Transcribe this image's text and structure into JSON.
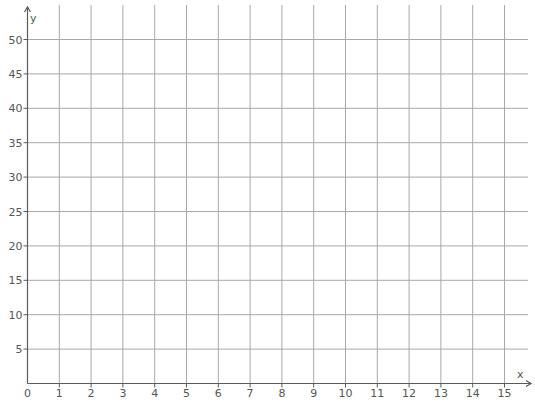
{
  "chart_data": {
    "type": "scatter",
    "title": "",
    "xlabel": "x",
    "ylabel": "y",
    "xlim": [
      0,
      15
    ],
    "ylim": [
      0,
      50
    ],
    "x_ticks": [
      0,
      1,
      2,
      3,
      4,
      5,
      6,
      7,
      8,
      9,
      10,
      11,
      12,
      13,
      14,
      15
    ],
    "y_ticks": [
      5,
      10,
      15,
      20,
      25,
      30,
      35,
      40,
      45,
      50
    ],
    "x_tick_labels": [
      "0",
      "1",
      "2",
      "3",
      "4",
      "5",
      "6",
      "7",
      "8",
      "9",
      "10",
      "11",
      "12",
      "13",
      "14",
      "15"
    ],
    "y_tick_labels": [
      "5",
      "10",
      "15",
      "20",
      "25",
      "30",
      "35",
      "40",
      "45",
      "50"
    ],
    "grid": true,
    "legend": null,
    "series": []
  },
  "colors": {
    "grid": "#a8a8a8",
    "axis": "#5a5a5a",
    "label": "#555555",
    "background": "#ffffff"
  },
  "layout": {
    "origin_x": 27.5,
    "origin_y": 383.5,
    "x_unit_px": 31.8,
    "y_unit_px": 6.88,
    "grid_top": 5,
    "grid_right": 528,
    "x_axis_end": 531,
    "y_axis_end": 7
  }
}
